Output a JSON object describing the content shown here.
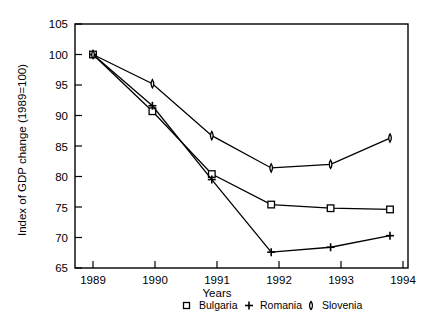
{
  "chart_data": {
    "type": "line",
    "title": "",
    "xlabel": "Years",
    "ylabel": "Index of GDP change (1989=100)",
    "x": [
      1989,
      1990,
      1991,
      1992,
      1993,
      1994
    ],
    "xtick_labels": [
      "1989",
      "1990",
      "1991",
      "1992",
      "1993",
      "1994"
    ],
    "ytick_labels": [
      "105",
      "100",
      "95",
      "90",
      "85",
      "80",
      "75",
      "70",
      "65"
    ],
    "yticks": [
      105,
      100,
      95,
      90,
      85,
      80,
      75,
      70,
      65
    ],
    "ylim": [
      65,
      105
    ],
    "xlim": [
      1989,
      1994
    ],
    "grid": false,
    "legend_position": "below-axis",
    "series": [
      {
        "name": "Bulgaria",
        "marker": "square",
        "values": [
          100.0,
          90.7,
          80.4,
          75.4,
          74.8,
          74.6
        ]
      },
      {
        "name": "Romania",
        "marker": "plus",
        "values": [
          100.0,
          91.6,
          79.5,
          67.6,
          68.4,
          70.3
        ]
      },
      {
        "name": "Slovenia",
        "marker": "lens",
        "values": [
          100.0,
          95.2,
          86.7,
          81.4,
          82.0,
          86.3
        ]
      }
    ],
    "legend": [
      {
        "label": "Bulgaria",
        "marker": "square"
      },
      {
        "label": "Romania",
        "marker": "plus"
      },
      {
        "label": "Slovenia",
        "marker": "lens"
      }
    ],
    "colors": {
      "line": "#000000",
      "marker_fill": "#ffffff",
      "background": "#ffffff",
      "axis": "#000000"
    }
  }
}
